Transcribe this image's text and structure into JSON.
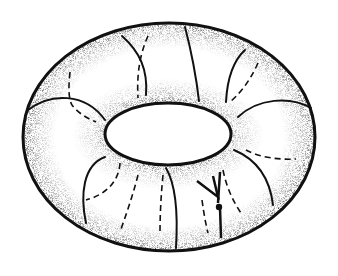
{
  "figure": {
    "colors": {
      "background": "#ffffff",
      "ink": "#111111",
      "shade": "#000000"
    },
    "outer_ellipse": {
      "cx": 169,
      "cy": 137,
      "rx": 146,
      "ry": 114
    },
    "inner_hole": {
      "cx": 168,
      "cy": 134,
      "rx": 63,
      "ry": 31
    },
    "meridians_solid": [
      "M122,36 C140,52 148,70 146,95",
      "M185,27 C191,50 196,75 199,101",
      "M245,50 C232,62 227,82 226,102",
      "M28,110 C50,93 85,92 105,120",
      "M238,117 C258,98 290,96 311,108",
      "M105,157 C83,165 80,195 86,223",
      "M166,168 C176,185 178,215 176,248",
      "M234,150 C258,160 270,180 273,205",
      "M220,205 L221,237"
    ],
    "meridians_dashed": [
      "M148,36 C138,58 137,80 138,98",
      "M70,72 C68,90 69,100 72,105 C78,113 88,119 96,122",
      "M258,63 C248,85 238,95 230,102",
      "M246,150 C258,157 278,160 296,159",
      "M120,163 C119,182 105,195 86,200",
      "M138,175 C133,195 126,215 120,232",
      "M163,175 C161,195 160,215 160,232",
      "M202,200 C204,215 206,225 208,233",
      "M223,170 C226,185 232,200 241,213"
    ],
    "arrow": {
      "shaft": "M220,172 L218,203",
      "head": "M197,181 L218,192 L214,175",
      "point": {
        "cx": 219,
        "cy": 207,
        "r": 3
      }
    }
  }
}
